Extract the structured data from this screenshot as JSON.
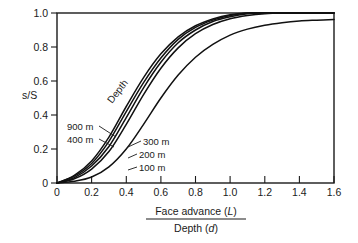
{
  "chart_data": {
    "type": "line",
    "title": "",
    "xlabel_numerator": "Face advance (L)",
    "xlabel_denominator": "Depth (d)",
    "xlabel_numerator_plain": "Face advance",
    "xlabel_numerator_italic": "L",
    "xlabel_denominator_plain": "Depth",
    "xlabel_denominator_italic": "d",
    "ylabel": "s/S",
    "xlim": [
      0,
      1.6
    ],
    "ylim": [
      0,
      1.0
    ],
    "xticks": [
      0,
      0.2,
      0.4,
      0.6,
      0.8,
      1.0,
      1.2,
      1.4,
      1.6
    ],
    "xticklabels": [
      "0",
      "0.2",
      "0.4",
      "0.6",
      "0.8",
      "1.0",
      "1.2",
      "1.4",
      "1.6"
    ],
    "yticks": [
      0,
      0.2,
      0.4,
      0.6,
      0.8,
      1.0
    ],
    "yticklabels": [
      "0",
      "0.2",
      "0.4",
      "0.6",
      "0.8",
      "1.0"
    ],
    "grid": false,
    "legend_position": "inline-annotations",
    "group_annotation": "Depth",
    "x": [
      0,
      0.1,
      0.2,
      0.3,
      0.4,
      0.5,
      0.6,
      0.7,
      0.8,
      0.9,
      1.0,
      1.1,
      1.2,
      1.3,
      1.4,
      1.5,
      1.6
    ],
    "series": [
      {
        "name": "900 m",
        "label": "900 m",
        "values": [
          0.0,
          0.045,
          0.13,
          0.27,
          0.45,
          0.62,
          0.76,
          0.86,
          0.925,
          0.965,
          0.99,
          1.0,
          1.0,
          1.0,
          1.0,
          1.0,
          1.0
        ]
      },
      {
        "name": "400 m",
        "label": "400 m",
        "values": [
          0.0,
          0.04,
          0.115,
          0.245,
          0.42,
          0.59,
          0.735,
          0.845,
          0.915,
          0.958,
          0.985,
          1.0,
          1.0,
          1.0,
          1.0,
          1.0,
          1.0
        ]
      },
      {
        "name": "300 m",
        "label": "300 m",
        "values": [
          0.0,
          0.032,
          0.1,
          0.215,
          0.385,
          0.56,
          0.71,
          0.825,
          0.9,
          0.95,
          0.978,
          0.995,
          1.0,
          1.0,
          1.0,
          1.0,
          1.0
        ]
      },
      {
        "name": "200 m",
        "label": "200 m",
        "values": [
          0.0,
          0.025,
          0.082,
          0.185,
          0.345,
          0.52,
          0.675,
          0.795,
          0.878,
          0.932,
          0.966,
          0.985,
          0.996,
          1.0,
          1.0,
          1.0,
          1.0
        ]
      },
      {
        "name": "100 m",
        "label": "100 m",
        "values": [
          0.0,
          0.01,
          0.035,
          0.095,
          0.2,
          0.345,
          0.5,
          0.635,
          0.74,
          0.815,
          0.87,
          0.905,
          0.928,
          0.943,
          0.953,
          0.958,
          0.962
        ]
      }
    ]
  },
  "annotations": {
    "depth": "Depth",
    "label_900": "900 m",
    "label_400": "400 m",
    "label_300": "300 m",
    "label_200": "200 m",
    "label_100": "100 m"
  },
  "axes": {
    "y_label": "s/S",
    "x_numerator_text": "Face advance (",
    "x_numerator_var": "L",
    "x_numerator_close": ")",
    "x_denominator_text": "Depth (",
    "x_denominator_var": "d",
    "x_denominator_close": ")",
    "y_tick_0": "0",
    "y_tick_02": "0.2",
    "y_tick_04": "0.4",
    "y_tick_06": "0.6",
    "y_tick_08": "0.8",
    "y_tick_10": "1.0",
    "x_tick_0": "0",
    "x_tick_02": "0.2",
    "x_tick_04": "0.4",
    "x_tick_06": "0.6",
    "x_tick_08": "0.8",
    "x_tick_10": "1.0",
    "x_tick_12": "1.2",
    "x_tick_14": "1.4",
    "x_tick_16": "1.6"
  },
  "colors": {
    "curve": "#111111",
    "axis": "#1a1a1a",
    "background": "#ffffff"
  }
}
